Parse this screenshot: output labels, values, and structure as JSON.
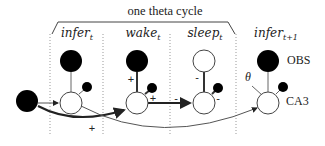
{
  "title": "one theta cycle",
  "columns": [
    {
      "base": "infer",
      "sub": "t"
    },
    {
      "base": "wake",
      "sub": "t"
    },
    {
      "base": "sleep",
      "sub": "t"
    },
    {
      "base": "infer",
      "sub": "t+1"
    }
  ],
  "side_labels": {
    "obs": "OBS",
    "ca3": "CA3"
  },
  "theta_label": "θ",
  "signs": {
    "input_plus": "+",
    "wake_obs_plus": "+",
    "wake_small_plus": "+",
    "sleep_arrow_minus": "-",
    "sleep_obs_minus": "-",
    "sleep_small_minus": "-"
  },
  "colors": {
    "filled": "#000000",
    "empty": "#ffffff",
    "stroke": "#333333",
    "dotted": "#999999"
  }
}
